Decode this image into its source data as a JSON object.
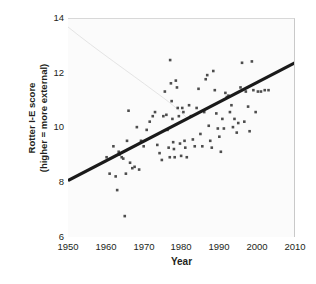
{
  "chart_data": {
    "type": "scatter",
    "title": "",
    "xlabel": "Year",
    "ylabel": "Rotter I-E score (higher = more external)",
    "ylabel_lines": [
      "Rotter I-E score",
      "(higher = more external)"
    ],
    "xlim": [
      1950,
      2010
    ],
    "ylim": [
      6,
      14
    ],
    "xticks": [
      1950,
      1960,
      1970,
      1980,
      1990,
      2000,
      2010
    ],
    "yticks": [
      6,
      8,
      10,
      12,
      14
    ],
    "grid": false,
    "legend": null,
    "marker": {
      "shape": "square",
      "size_px": 2.6,
      "color": "#4d4d4d"
    },
    "trendline": {
      "type": "linear",
      "x": [
        1950,
        2010
      ],
      "y": [
        8.1,
        12.4
      ],
      "color": "#1a1a1a",
      "width_px": 3.1
    },
    "points": [
      [
        1960.2,
        8.95
      ],
      [
        1961.0,
        8.35
      ],
      [
        1962.0,
        9.35
      ],
      [
        1962.6,
        8.25
      ],
      [
        1963.0,
        7.75
      ],
      [
        1963.4,
        9.15
      ],
      [
        1963.6,
        9.05
      ],
      [
        1964.2,
        8.95
      ],
      [
        1964.6,
        8.9
      ],
      [
        1965.0,
        6.8
      ],
      [
        1965.3,
        8.35
      ],
      [
        1965.6,
        9.55
      ],
      [
        1966.0,
        10.65
      ],
      [
        1966.4,
        8.75
      ],
      [
        1967.0,
        8.55
      ],
      [
        1967.6,
        8.6
      ],
      [
        1968.2,
        10.05
      ],
      [
        1968.8,
        8.5
      ],
      [
        1969.3,
        9.55
      ],
      [
        1970.0,
        9.35
      ],
      [
        1970.8,
        9.95
      ],
      [
        1971.6,
        10.25
      ],
      [
        1972.4,
        10.45
      ],
      [
        1973.0,
        10.6
      ],
      [
        1973.6,
        9.4
      ],
      [
        1974.2,
        9.1
      ],
      [
        1974.8,
        8.85
      ],
      [
        1975.2,
        10.45
      ],
      [
        1975.6,
        11.35
      ],
      [
        1976.0,
        10.5
      ],
      [
        1976.3,
        9.95
      ],
      [
        1976.6,
        9.3
      ],
      [
        1976.9,
        8.95
      ],
      [
        1977.0,
        12.5
      ],
      [
        1977.2,
        11.65
      ],
      [
        1977.4,
        11.0
      ],
      [
        1977.6,
        10.35
      ],
      [
        1977.8,
        9.5
      ],
      [
        1978.0,
        9.25
      ],
      [
        1978.2,
        8.95
      ],
      [
        1978.5,
        11.75
      ],
      [
        1978.8,
        11.5
      ],
      [
        1979.0,
        10.75
      ],
      [
        1979.3,
        10.45
      ],
      [
        1979.6,
        9.45
      ],
      [
        1979.9,
        9.0
      ],
      [
        1980.2,
        10.75
      ],
      [
        1980.5,
        10.6
      ],
      [
        1980.8,
        9.55
      ],
      [
        1981.0,
        9.3
      ],
      [
        1981.4,
        8.95
      ],
      [
        1982.0,
        10.85
      ],
      [
        1982.5,
        10.45
      ],
      [
        1983.0,
        9.6
      ],
      [
        1983.5,
        9.35
      ],
      [
        1984.0,
        10.75
      ],
      [
        1984.5,
        11.45
      ],
      [
        1985.0,
        9.8
      ],
      [
        1985.5,
        9.35
      ],
      [
        1986.0,
        10.6
      ],
      [
        1986.4,
        11.8
      ],
      [
        1986.8,
        11.95
      ],
      [
        1987.2,
        10.1
      ],
      [
        1987.6,
        9.55
      ],
      [
        1988.0,
        9.3
      ],
      [
        1988.4,
        12.1
      ],
      [
        1988.8,
        11.4
      ],
      [
        1989.2,
        10.55
      ],
      [
        1989.6,
        10.0
      ],
      [
        1990.0,
        9.7
      ],
      [
        1990.4,
        9.15
      ],
      [
        1990.8,
        10.35
      ],
      [
        1991.2,
        10.0
      ],
      [
        1991.6,
        11.3
      ],
      [
        1992.0,
        11.15
      ],
      [
        1992.4,
        11.2
      ],
      [
        1992.8,
        10.6
      ],
      [
        1993.2,
        10.85
      ],
      [
        1993.6,
        10.05
      ],
      [
        1994.0,
        10.35
      ],
      [
        1994.6,
        9.85
      ],
      [
        1995.0,
        10.2
      ],
      [
        1995.6,
        11.5
      ],
      [
        1996.0,
        12.4
      ],
      [
        1996.6,
        10.25
      ],
      [
        1997.0,
        11.35
      ],
      [
        1997.6,
        10.8
      ],
      [
        1998.0,
        9.9
      ],
      [
        1998.6,
        12.45
      ],
      [
        1999.0,
        11.4
      ],
      [
        1999.6,
        10.6
      ],
      [
        2000.2,
        11.35
      ],
      [
        2001.0,
        11.35
      ],
      [
        2002.0,
        11.4
      ],
      [
        2003.0,
        11.4
      ]
    ]
  }
}
